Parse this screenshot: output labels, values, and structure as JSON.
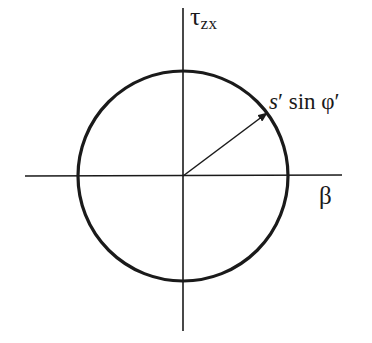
{
  "diagram": {
    "axes": {
      "vertical": {
        "label_main": "τ",
        "label_sub": "zx"
      },
      "horizontal": {
        "label": "β"
      }
    },
    "circle": {
      "center_px": [
        183,
        176
      ],
      "radius_px": 105
    },
    "radius_vector": {
      "label_var": "s",
      "label_prime": "′",
      "label_rest": " sin φ′"
    },
    "colors": {
      "stroke": "#1a1a1a",
      "background": "#ffffff"
    }
  }
}
